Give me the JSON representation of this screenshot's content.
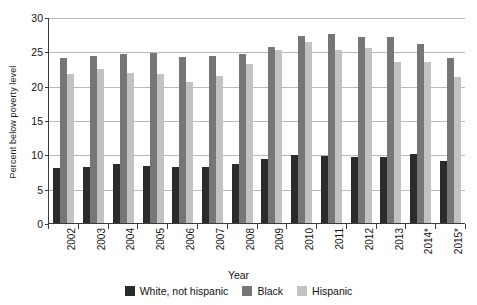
{
  "chart_data": {
    "type": "bar",
    "title": "",
    "xlabel": "Year",
    "ylabel": "Percent below poverty level",
    "ylim": [
      0,
      30
    ],
    "yticks": [
      0,
      5,
      10,
      15,
      20,
      25,
      30
    ],
    "grid": true,
    "legend_position": "bottom",
    "categories": [
      "2002",
      "2003",
      "2004",
      "2005",
      "2006",
      "2007",
      "2008",
      "2009",
      "2010",
      "2011",
      "2012",
      "2013",
      "2014*",
      "2015*"
    ],
    "series": [
      {
        "name": "White, not hispanic",
        "color": "#2b2b2b",
        "values": [
          8.0,
          8.2,
          8.7,
          8.3,
          8.2,
          8.2,
          8.6,
          9.4,
          9.9,
          9.8,
          9.7,
          9.6,
          10.1,
          9.1
        ]
      },
      {
        "name": "Black",
        "color": "#767676",
        "values": [
          24.1,
          24.4,
          24.7,
          24.9,
          24.3,
          24.5,
          24.7,
          25.8,
          27.4,
          27.6,
          27.2,
          27.2,
          26.2,
          24.1
        ]
      },
      {
        "name": "Hispanic",
        "color": "#c2c2c2",
        "values": [
          21.8,
          22.5,
          21.9,
          21.8,
          20.6,
          21.5,
          23.2,
          25.3,
          26.5,
          25.3,
          25.6,
          23.5,
          23.6,
          21.4
        ]
      }
    ]
  },
  "legend": {
    "items": [
      {
        "label": "White, not hispanic"
      },
      {
        "label": "Black"
      },
      {
        "label": "Hispanic"
      }
    ]
  }
}
